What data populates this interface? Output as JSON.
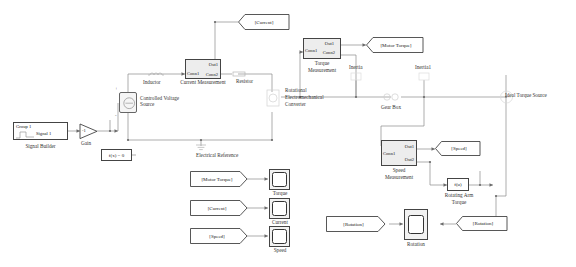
{
  "diagram": {
    "type": "simulink-block-diagram",
    "background": "#ffffff",
    "line_color": "#8a8a8a"
  },
  "blocks": {
    "signal_builder": {
      "label": "Signal Builder",
      "group": "Group 1",
      "signal": "Signal 1"
    },
    "gain": {
      "label": "Gain",
      "value": "-1"
    },
    "solver": {
      "label": "f(x) = 0"
    },
    "controlled_voltage_source": {
      "label": "Controlled Voltage\nSource",
      "port_plus": "+",
      "port_minus": "-"
    },
    "inductor": {
      "label": "Inductor"
    },
    "resistor": {
      "label": "Resistor"
    },
    "electrical_reference": {
      "label": "Electrical Reference"
    },
    "current_measurement": {
      "label": "Current Measurement",
      "ports": {
        "conn1": "Conn1",
        "conn2": "Conn2",
        "out1": "Out1"
      }
    },
    "torque_measurement": {
      "label": "Torque\nMeasurement",
      "ports": {
        "conn1": "Conn1",
        "conn2": "Conn2",
        "out1": "Out1"
      }
    },
    "speed_measurement": {
      "label": "Speed\nMeasurement",
      "ports": {
        "conn1": "Conn1",
        "out1": "Out1",
        "out2": "Out2"
      }
    },
    "rotational_converter": {
      "label": "Rotational\nElectromechanical\nConverter"
    },
    "inertia": {
      "label": "Inertia"
    },
    "inertia1": {
      "label": "Inertia1"
    },
    "gear_box": {
      "label": "Gear Box"
    },
    "ideal_torque_source": {
      "label": "Ideal Torque Source"
    },
    "rotating_arm_torque": {
      "label": "Rotating Arm\nTorque",
      "expr": "f(u)"
    }
  },
  "tags": {
    "current_goto": "[Current]",
    "motor_torque_goto": "[Motor Torque]",
    "speed_goto": "[Speed]",
    "rotation_goto": "[Rotation]",
    "motor_torque_from": "[Motor Torque]",
    "current_from": "[Current]",
    "speed_from": "[Speed]",
    "rotation_from": "[Rotation]"
  },
  "scopes": {
    "torque": "Torque",
    "current": "Current",
    "speed": "Speed",
    "rotation": "Rotation"
  }
}
